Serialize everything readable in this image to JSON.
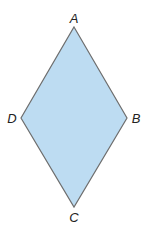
{
  "figure": {
    "shape": "rhombus",
    "fill_color": "#BDDCF2",
    "stroke_color": "#6E6E6E",
    "vertices": [
      {
        "name": "A",
        "x": 74,
        "y": 27,
        "label_x": 74,
        "label_y": 18
      },
      {
        "name": "B",
        "x": 127,
        "y": 118,
        "label_x": 136,
        "label_y": 118
      },
      {
        "name": "C",
        "x": 74,
        "y": 207,
        "label_x": 74,
        "label_y": 217
      },
      {
        "name": "D",
        "x": 21,
        "y": 118,
        "label_x": 12,
        "label_y": 118
      }
    ]
  },
  "labels": {
    "a": "A",
    "b": "B",
    "c": "C",
    "d": "D"
  }
}
